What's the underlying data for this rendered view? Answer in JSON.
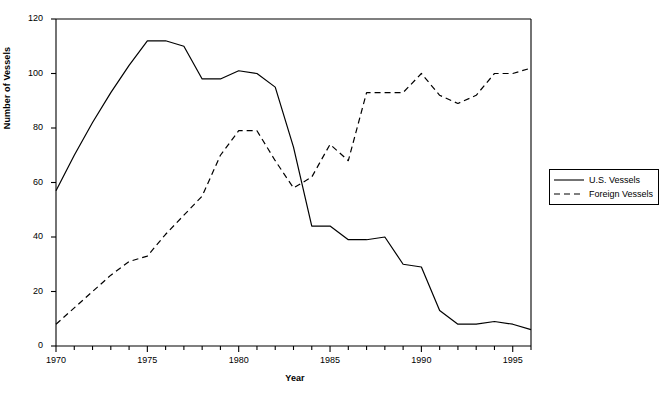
{
  "chart_data": {
    "type": "line",
    "title": "",
    "xlabel": "Year",
    "ylabel": "Number of Vessels",
    "xlim": [
      1970,
      1996
    ],
    "ylim": [
      0,
      120
    ],
    "grid": false,
    "legend_position": "right-outside",
    "x": [
      1970,
      1971,
      1972,
      1973,
      1974,
      1975,
      1976,
      1977,
      1978,
      1979,
      1980,
      1981,
      1982,
      1983,
      1984,
      1985,
      1986,
      1987,
      1988,
      1989,
      1990,
      1991,
      1992,
      1993,
      1994,
      1995,
      1996
    ],
    "xtick_labels": [
      "1970",
      "1975",
      "1980",
      "1985",
      "1990",
      "1995"
    ],
    "xtick_values": [
      1970,
      1975,
      1980,
      1985,
      1990,
      1995
    ],
    "ytick_labels": [
      "0",
      "20",
      "40",
      "60",
      "80",
      "100",
      "120"
    ],
    "ytick_values": [
      0,
      20,
      40,
      60,
      80,
      100,
      120
    ],
    "series": [
      {
        "name": "U.S. Vessels",
        "style": "solid",
        "color": "#000000",
        "values": [
          57,
          70,
          82,
          93,
          103,
          112,
          112,
          110,
          98,
          98,
          101,
          100,
          95,
          73,
          44,
          44,
          39,
          39,
          40,
          30,
          29,
          13,
          8,
          8,
          9,
          8,
          6
        ]
      },
      {
        "name": "Foreign Vessels",
        "style": "dashed",
        "color": "#000000",
        "values": [
          8,
          14,
          20,
          26,
          31,
          33,
          41,
          48,
          55,
          70,
          79,
          79,
          68,
          58,
          62,
          74,
          68,
          93,
          93,
          93,
          100,
          92,
          89,
          92,
          100,
          100,
          102
        ]
      }
    ]
  },
  "legend": {
    "items": [
      {
        "label": "U.S. Vessels",
        "style": "solid"
      },
      {
        "label": "Foreign Vessels",
        "style": "dashed"
      }
    ]
  }
}
